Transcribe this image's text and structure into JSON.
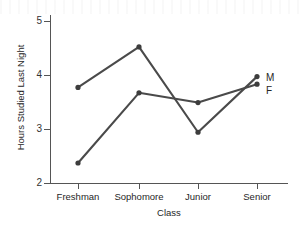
{
  "chart_data": {
    "type": "line",
    "title": "",
    "xlabel": "Class",
    "ylabel": "Hours Studied Last Night",
    "categories": [
      "Freshman",
      "Sophomore",
      "Junior",
      "Senior"
    ],
    "ylim": [
      2,
      5
    ],
    "yticks": [
      2,
      3,
      4,
      5
    ],
    "ytick_labels": [
      "2",
      "3",
      "4",
      "5"
    ],
    "grid": false,
    "legend_position": "right-inline-endpoint",
    "series": [
      {
        "name": "M",
        "label": "M",
        "color": "#4a4a4a",
        "values": [
          3.77,
          4.52,
          2.94,
          3.97
        ]
      },
      {
        "name": "F",
        "label": "F",
        "color": "#4a4a4a",
        "values": [
          2.37,
          3.67,
          3.49,
          3.83
        ]
      }
    ]
  },
  "colors": {
    "line": "#4a4a4a",
    "marker": "#3d3d3d",
    "axis": "#555555",
    "text": "#262626",
    "background": "#ffffff"
  }
}
